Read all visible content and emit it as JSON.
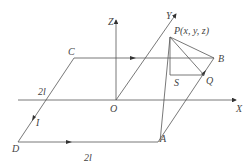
{
  "diagram": {
    "axes": {
      "x": "X",
      "y": "Y",
      "z": "Z",
      "origin": "O"
    },
    "points": {
      "A": "A",
      "B": "B",
      "C": "C",
      "D": "D",
      "P": "P(x, y, z)",
      "S": "S",
      "Q": "Q"
    },
    "dimensions": {
      "side_cb": "2l",
      "side_da": "2l",
      "current_label": "I"
    },
    "colors": {
      "line": "#555555",
      "text": "#444444",
      "background": "#ffffff"
    }
  }
}
